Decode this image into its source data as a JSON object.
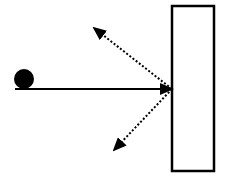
{
  "diagram": {
    "colors": {
      "stroke": "#000000",
      "background": "#ffffff",
      "wall_fill": "#ffffff"
    },
    "ball": {
      "cx": 24,
      "cy": 79,
      "r": 10
    },
    "incident_path": {
      "x1": 15,
      "y1": 89,
      "x2": 172,
      "y2": 89,
      "style": "solid"
    },
    "wall": {
      "x": 172,
      "y": 6,
      "width": 42,
      "height": 165
    },
    "deflection_paths": [
      {
        "name": "upper-reflection",
        "x1": 172,
        "y1": 89,
        "x2": 94,
        "y2": 28,
        "style": "dotted"
      },
      {
        "name": "lower-reflection",
        "x1": 172,
        "y1": 89,
        "x2": 114,
        "y2": 150,
        "style": "dotted"
      }
    ]
  }
}
